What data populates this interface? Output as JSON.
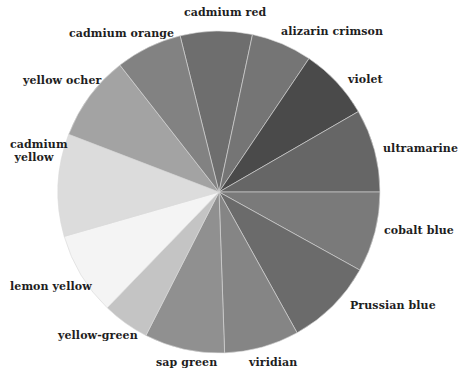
{
  "diagram": {
    "type": "color-wheel",
    "center": [
      219,
      192
    ],
    "radius": 161,
    "wedges": [
      {
        "name": "cadmium red",
        "start": -14,
        "end": 12,
        "fill": "#6e6e6e"
      },
      {
        "name": "alizarin crimson",
        "start": 12,
        "end": 34,
        "fill": "#757575"
      },
      {
        "name": "violet",
        "start": 34,
        "end": 60,
        "fill": "#4a4a4a"
      },
      {
        "name": "ultramarine",
        "start": 60,
        "end": 90,
        "fill": "#666666"
      },
      {
        "name": "cobalt blue",
        "start": 90,
        "end": 119,
        "fill": "#7a7a7a"
      },
      {
        "name": "Prussian blue",
        "start": 119,
        "end": 151,
        "fill": "#6b6b6b"
      },
      {
        "name": "viridian",
        "start": 151,
        "end": 178,
        "fill": "#858585"
      },
      {
        "name": "sap green",
        "start": 178,
        "end": 207,
        "fill": "#909090"
      },
      {
        "name": "yellow-green",
        "start": 207,
        "end": 224,
        "fill": "#c4c4c4"
      },
      {
        "name": "lemon yellow",
        "start": 224,
        "end": 254,
        "fill": "#f4f4f4"
      },
      {
        "name": "cadmium yellow",
        "start": 254,
        "end": 291,
        "fill": "#dcdcdc"
      },
      {
        "name": "yellow ocher",
        "start": 291,
        "end": 322,
        "fill": "#a3a3a3"
      },
      {
        "name": "cadmium orange",
        "start": 322,
        "end": 346,
        "fill": "#828282"
      }
    ]
  },
  "labels": {
    "cadmium_red": "cadmium red",
    "alizarin_crimson": "alizarin crimson",
    "violet": "violet",
    "ultramarine": "ultramarine",
    "cobalt_blue": "cobalt blue",
    "prussian_blue": "Prussian blue",
    "viridian": "viridian",
    "sap_green": "sap green",
    "yellow_green": "yellow-green",
    "lemon_yellow": "lemon yellow",
    "cadmium_yellow_line1": "cadmium",
    "cadmium_yellow_line2": "yellow",
    "yellow_ocher": "yellow ocher",
    "cadmium_orange": "cadmium orange"
  }
}
